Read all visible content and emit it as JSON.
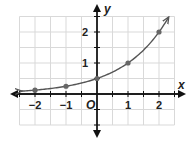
{
  "chart_data": {
    "type": "line",
    "title": "",
    "function": "y = 0.5 * 2^x",
    "xlabel": "x",
    "ylabel": "y",
    "origin_label": "O",
    "xlim": [
      -2.5,
      2.5
    ],
    "ylim": [
      -1,
      2.5
    ],
    "grid": true,
    "grid_step": 0.5,
    "x_ticks": [
      -2,
      -1,
      1,
      2
    ],
    "x_tick_labels": [
      "−2",
      "−1",
      "1",
      "2"
    ],
    "y_ticks": [
      1,
      2
    ],
    "y_tick_labels": [
      "1",
      "2"
    ],
    "points": [
      {
        "x": -2,
        "y": 0.125
      },
      {
        "x": -1,
        "y": 0.25
      },
      {
        "x": 0,
        "y": 0.5
      },
      {
        "x": 1,
        "y": 1
      },
      {
        "x": 2,
        "y": 2
      }
    ],
    "curve_arrows": "both ends",
    "colors": {
      "curve": "#555555",
      "axes": "#111111",
      "grid": "#d9d9d9",
      "points": "#666666"
    }
  }
}
